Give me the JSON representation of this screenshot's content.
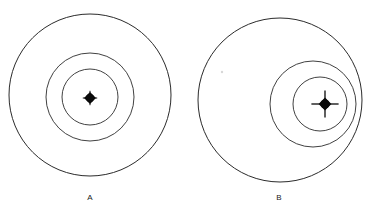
{
  "figure": {
    "title": "",
    "background_color": "#ffffff",
    "stroke_color": "#2b2b2b",
    "marker_color": "#0a0a0a",
    "width": 372,
    "height": 210,
    "panels": [
      {
        "id": "A",
        "label": "A",
        "label_x": 90,
        "label_y": 197,
        "arrangement": "concentric",
        "marker": {
          "name": "center-marker",
          "cx": 90,
          "cy": 98,
          "dot_radius": 4.2,
          "spike_length": 3.0,
          "spike_width": 1.0,
          "style": "filled-dot-with-short-spikes"
        },
        "circles": [
          {
            "name": "outer-circle",
            "cx": 90,
            "cy": 95,
            "r": 81
          },
          {
            "name": "middle-circle",
            "cx": 90,
            "cy": 97,
            "r": 44
          },
          {
            "name": "inner-circle",
            "cx": 90,
            "cy": 97,
            "r": 28
          }
        ]
      },
      {
        "id": "B",
        "label": "B",
        "label_x": 279,
        "label_y": 197,
        "arrangement": "eccentric",
        "marker": {
          "name": "center-marker",
          "cx": 325,
          "cy": 104,
          "dot_radius": 4.6,
          "spike_length": 9.0,
          "spike_width": 1.3,
          "style": "filled-dot-with-crosshair-spikes"
        },
        "circles": [
          {
            "name": "outer-circle",
            "cx": 280,
            "cy": 100,
            "r": 82
          },
          {
            "name": "middle-circle",
            "cx": 313,
            "cy": 104,
            "r": 43
          },
          {
            "name": "inner-circle",
            "cx": 320,
            "cy": 104,
            "r": 27
          }
        ],
        "speck": {
          "name": "paper-speck",
          "cx": 222,
          "cy": 72,
          "r": 1.2
        }
      }
    ]
  }
}
